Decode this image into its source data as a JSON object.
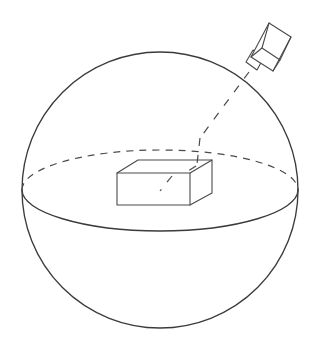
{
  "figure": {
    "title": "Sphere with inscribed cuboid and camera viewing ray",
    "background_color": "#ffffff",
    "line_color": "#3b3b3b",
    "dash_color": "#4a4a4a",
    "elements": [
      {
        "name": "sphere-outline",
        "shape": "circle",
        "center": [
          160,
          190
        ],
        "radius": 138,
        "style": "solid"
      },
      {
        "name": "equator-front-arc",
        "shape": "ellipse-arc-front",
        "center": [
          160,
          190
        ],
        "radius_x": 138,
        "radius_y": 40,
        "style": "solid"
      },
      {
        "name": "equator-back-arc",
        "shape": "ellipse-arc-back",
        "center": [
          160,
          190
        ],
        "radius_x": 138,
        "radius_y": 40,
        "style": "dashed"
      },
      {
        "name": "cuboid",
        "shape": "box",
        "front_face": [
          [
            117,
            173
          ],
          [
            190,
            173
          ],
          [
            190,
            205
          ],
          [
            117,
            205
          ]
        ],
        "top_face": [
          [
            117,
            173
          ],
          [
            138,
            160
          ],
          [
            212,
            160
          ],
          [
            190,
            173
          ]
        ],
        "right_face": [
          [
            190,
            173
          ],
          [
            212,
            160
          ],
          [
            212,
            193
          ],
          [
            190,
            205
          ]
        ],
        "style": "solid"
      },
      {
        "name": "camera",
        "shape": "camera-body",
        "body": [
          [
            249,
            57
          ],
          [
            268,
            22
          ],
          [
            289,
            36
          ],
          [
            272,
            70
          ]
        ],
        "lens": [
          [
            244,
            64
          ],
          [
            252,
            53
          ],
          [
            262,
            60
          ],
          [
            254,
            71
          ]
        ],
        "style": "solid"
      },
      {
        "name": "sight-ray",
        "shape": "dashed-line",
        "from": [
          250,
          70
        ],
        "to": [
          163,
          187
        ],
        "style": "dashed"
      }
    ]
  }
}
